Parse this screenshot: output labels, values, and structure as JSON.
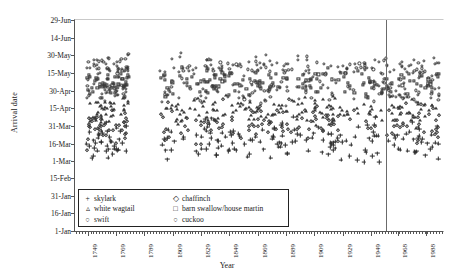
{
  "chart_data": {
    "type": "scatter",
    "title": "",
    "xlabel": "Year",
    "ylabel": "Arrival date",
    "xlim": [
      1740,
      2000
    ],
    "ylim_labels": [
      "1-Jan",
      "29-Jun"
    ],
    "grid": false,
    "legend_position": "inside-bottom-left",
    "x_ticks": [
      "1749",
      "1769",
      "1789",
      "1809",
      "1829",
      "1849",
      "1869",
      "1889",
      "1909",
      "1929",
      "1949",
      "1968",
      "1988"
    ],
    "x_tick_values": [
      1749,
      1769,
      1789,
      1809,
      1829,
      1849,
      1869,
      1889,
      1909,
      1929,
      1949,
      1968,
      1988
    ],
    "x_minor_tick_step": 2,
    "y_ticks": [
      "1-Jan",
      "16-Jan",
      "31-Jan",
      "15-Feb",
      "1-Mar",
      "16-Mar",
      "31-Mar",
      "15-Apr",
      "30-Apr",
      "15-May",
      "30-May",
      "14-Jun",
      "29-Jun"
    ],
    "y_tick_day_of_year": [
      1,
      16,
      31,
      46,
      60,
      75,
      90,
      105,
      120,
      135,
      150,
      165,
      180
    ],
    "annotations": [
      {
        "type": "vertical-line",
        "x": 1960,
        "label": ""
      }
    ],
    "series": [
      {
        "name": "skylark",
        "marker": "plus",
        "mean_day": 78,
        "spread": 14,
        "count": 190
      },
      {
        "name": "white wagtail",
        "marker": "triangle",
        "mean_day": 104,
        "spread": 9,
        "count": 190
      },
      {
        "name": "swift",
        "marker": "circle",
        "mean_day": 140,
        "spread": 8,
        "count": 190
      },
      {
        "name": "chaffinch",
        "marker": "diamond",
        "mean_day": 92,
        "spread": 13,
        "count": 150
      },
      {
        "name": "barn swallow/house martin",
        "marker": "square",
        "mean_day": 127,
        "spread": 9,
        "count": 190
      },
      {
        "name": "cuckoo",
        "marker": "circle-small",
        "mean_day": 120,
        "spread": 9,
        "count": 160
      }
    ]
  },
  "legend": {
    "left_column": [
      {
        "marker": "+",
        "label": "skylark"
      },
      {
        "marker": "▵",
        "label": "white wagtail"
      },
      {
        "marker": "○",
        "label": "swift"
      }
    ],
    "right_column": [
      {
        "marker": "◇",
        "label": "chaffinch"
      },
      {
        "marker": "□",
        "label": "barn swallow/house martin"
      },
      {
        "marker": "○",
        "label": "cuckoo"
      }
    ]
  },
  "axes": {
    "y_title": "Arrival date",
    "x_title": "Year"
  },
  "colors": {
    "marker": "#3a3a3a",
    "axis": "#555555",
    "divider": "#6b6b6b",
    "background": "#ffffff"
  }
}
